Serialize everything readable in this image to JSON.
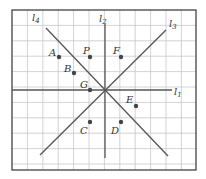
{
  "diagram": {
    "frame": {
      "x": 12,
      "y": 10,
      "w": 184,
      "h": 160
    },
    "grid_spacing": 15.4,
    "center": {
      "x": 105,
      "y": 90
    },
    "colors": {
      "grid": "#c8c8c8",
      "frame": "#333333",
      "line": "#555555",
      "point": "#444444",
      "text": "#333333"
    },
    "lines": [
      {
        "id": "l1",
        "label": "l",
        "sub": "1",
        "x1": 12,
        "y1": 90,
        "x2": 172,
        "y2": 90,
        "lx": 174,
        "ly": 95
      },
      {
        "id": "l2",
        "label": "l",
        "sub": "2",
        "x1": 105,
        "y1": 24,
        "x2": 105,
        "y2": 158,
        "lx": 99,
        "ly": 22
      },
      {
        "id": "l3",
        "label": "l",
        "sub": "3",
        "x1": 40,
        "y1": 155,
        "x2": 166,
        "y2": 30,
        "lx": 169,
        "ly": 27
      },
      {
        "id": "l4",
        "label": "l",
        "sub": "4",
        "x1": 46,
        "y1": 28,
        "x2": 168,
        "y2": 156,
        "lx": 32,
        "ly": 21
      }
    ],
    "points": [
      {
        "name": "A",
        "x": 59,
        "y": 57,
        "lx": 49,
        "ly": 56
      },
      {
        "name": "P",
        "x": 90,
        "y": 57,
        "lx": 83,
        "ly": 54
      },
      {
        "name": "F",
        "x": 121,
        "y": 57,
        "lx": 113,
        "ly": 54
      },
      {
        "name": "B",
        "x": 74,
        "y": 73,
        "lx": 64,
        "ly": 72
      },
      {
        "name": "G",
        "x": 90,
        "y": 90,
        "lx": 80,
        "ly": 88
      },
      {
        "name": "E",
        "x": 136,
        "y": 106,
        "lx": 126,
        "ly": 103
      },
      {
        "name": "C",
        "x": 90,
        "y": 122,
        "lx": 80,
        "ly": 134
      },
      {
        "name": "D",
        "x": 121,
        "y": 122,
        "lx": 111,
        "ly": 134
      }
    ]
  }
}
